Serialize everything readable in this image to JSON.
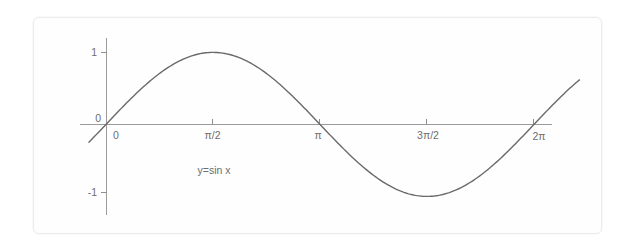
{
  "figure": {
    "background_color": "#ffffff",
    "frame_color": "#ececec",
    "curve_color": "#6a6a6a",
    "axis_color": "#9b9b9b",
    "text_color": "#6d6d6d"
  },
  "chart_data": {
    "type": "line",
    "title": "",
    "subtitle": "",
    "xlabel": "",
    "ylabel": "",
    "annotation": "y=sin x",
    "grid": false,
    "legend": "none",
    "function": "y = sin x",
    "xlim": [
      -0.25,
      6.95
    ],
    "ylim": [
      -1.35,
      1.35
    ],
    "xtick_values": [
      0,
      1.5707963,
      3.1415927,
      4.712389,
      6.2831853
    ],
    "xtick_labels": [
      "0",
      "π/2",
      "π",
      "3π/2",
      "2π"
    ],
    "ytick_values": [
      1,
      0,
      -1
    ],
    "ytick_labels": [
      "1",
      "0",
      "-1"
    ],
    "x": [
      -0.25,
      0.0,
      0.3926991,
      0.7853982,
      1.1780972,
      1.5707963,
      1.9634954,
      2.3561945,
      2.7488936,
      3.1415927,
      3.5342917,
      3.9269908,
      4.3196899,
      4.712389,
      5.1050881,
      5.4977871,
      5.8904862,
      6.2831853,
      6.6758844,
      6.95
    ],
    "y": [
      -0.2474,
      0.0,
      0.3827,
      0.7071,
      0.9239,
      1.0,
      0.9239,
      0.7071,
      0.3827,
      0.0,
      -0.3827,
      -0.7071,
      -0.9239,
      -1.0,
      -0.9239,
      -0.7071,
      -0.3827,
      0.0,
      0.3827,
      0.5859
    ],
    "key_points": [
      {
        "label": "zero at 0",
        "x": 0,
        "y": 0
      },
      {
        "label": "maximum at π/2",
        "x": 1.5707963,
        "y": 1
      },
      {
        "label": "zero at π",
        "x": 3.1415927,
        "y": 0
      },
      {
        "label": "minimum at 3π/2",
        "x": 4.712389,
        "y": -1
      },
      {
        "label": "zero at 2π",
        "x": 6.2831853,
        "y": 0
      }
    ]
  },
  "labels": {
    "y_top": "1",
    "y_origin": "0",
    "y_bottom": "-1",
    "x_origin": "0",
    "x_half_pi": "π/2",
    "x_pi": "π",
    "x_three_half_pi": "3π/2",
    "x_two_pi": "2π",
    "curve_equation": "y=sin x"
  }
}
